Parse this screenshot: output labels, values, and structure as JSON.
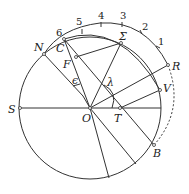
{
  "diagram": {
    "title": "",
    "points": [
      {
        "id": "S",
        "label": "S"
      },
      {
        "id": "O",
        "label": "O"
      },
      {
        "id": "T",
        "label": "T"
      },
      {
        "id": "N",
        "label": "N"
      },
      {
        "id": "C",
        "label": "C"
      },
      {
        "id": "F",
        "label": "F"
      },
      {
        "id": "Sigma",
        "label": "Σ"
      },
      {
        "id": "R",
        "label": "R"
      },
      {
        "id": "V",
        "label": "V"
      },
      {
        "id": "B",
        "label": "B"
      }
    ],
    "angles": [
      {
        "id": "epsilon",
        "label": "ϵ"
      },
      {
        "id": "lambda",
        "label": "λ"
      }
    ],
    "ticks": [
      "1",
      "2",
      "3",
      "4",
      "5",
      "6"
    ]
  }
}
